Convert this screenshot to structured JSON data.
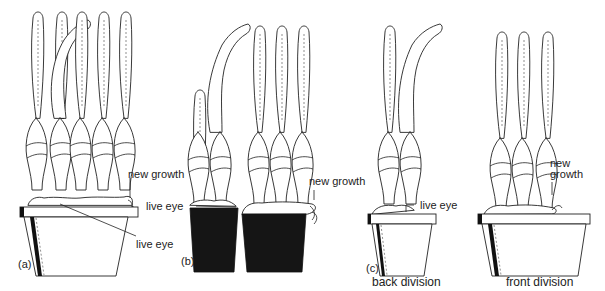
{
  "figure": {
    "panels": [
      {
        "id": "a",
        "label": "(a)",
        "annotations": [
          "new growth",
          "live eye"
        ],
        "fans": 5,
        "container": "pot"
      },
      {
        "id": "b",
        "label": "(b)",
        "annotations": [
          "new growth",
          "live eye"
        ],
        "fans": 5,
        "container": "root-ball split in two"
      },
      {
        "id": "c",
        "label": "(c)",
        "caption": "back division",
        "annotations": [
          "live eye"
        ],
        "fans": 2,
        "container": "pot"
      },
      {
        "id": "d",
        "label": "",
        "caption": "front division",
        "annotations": [
          "new growth"
        ],
        "fans": 3,
        "container": "pot"
      }
    ]
  },
  "labels": {
    "a_panel": "(a)",
    "a_new_growth": "new growth",
    "a_live_eye": "live eye",
    "b_panel": "(b)",
    "b_live_eye": "live eye",
    "b_new_growth": "new growth",
    "c_panel": "(c)",
    "c_live_eye": "live eye",
    "c_caption": "back division",
    "d_new_growth_1": "new",
    "d_new_growth_2": "growth",
    "d_caption": "front division"
  },
  "colors": {
    "line": "#222222",
    "soil": "#151515",
    "background": "#ffffff"
  }
}
